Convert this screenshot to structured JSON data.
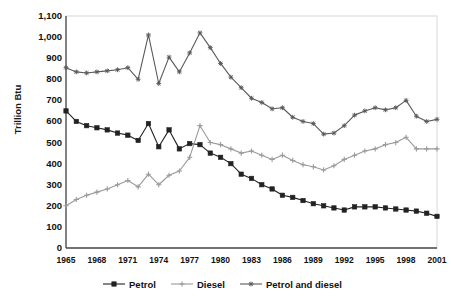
{
  "title": "",
  "axes": {
    "ylabel": "Trillion Btu",
    "yticks": [
      "1,100",
      "1,000",
      "900",
      "800",
      "700",
      "600",
      "500",
      "400",
      "300",
      "200",
      "100",
      "0"
    ],
    "xticks": [
      "1965",
      "1968",
      "1971",
      "1974",
      "1977",
      "1980",
      "1983",
      "1986",
      "1989",
      "1992",
      "1995",
      "1998",
      "2001"
    ]
  },
  "legend": {
    "items": [
      {
        "label": "Petrol",
        "marker": "square-marker",
        "color": "#222222"
      },
      {
        "label": "Diesel",
        "marker": "plus-marker",
        "color": "#9a9a9a"
      },
      {
        "label": "Petrol and diesel",
        "marker": "star-marker",
        "color": "#5a5a5a"
      }
    ]
  },
  "chart_data": {
    "type": "line",
    "title": "",
    "xlabel": "",
    "ylabel": "Trillion Btu",
    "ylim": [
      0,
      1100
    ],
    "ytick_step": 100,
    "grid": false,
    "legend_position": "bottom",
    "x": [
      1965,
      1966,
      1967,
      1968,
      1969,
      1970,
      1971,
      1972,
      1973,
      1974,
      1975,
      1976,
      1977,
      1978,
      1979,
      1980,
      1981,
      1982,
      1983,
      1984,
      1985,
      1986,
      1987,
      1988,
      1989,
      1990,
      1991,
      1992,
      1993,
      1994,
      1995,
      1996,
      1997,
      1998,
      1999,
      2000,
      2001
    ],
    "series": [
      {
        "name": "Petrol",
        "color": "#222222",
        "marker": "square-marker",
        "values": [
          650,
          600,
          580,
          570,
          560,
          545,
          535,
          510,
          590,
          480,
          560,
          470,
          495,
          490,
          450,
          430,
          400,
          350,
          330,
          300,
          280,
          250,
          240,
          225,
          210,
          200,
          190,
          180,
          195,
          195,
          195,
          190,
          185,
          180,
          175,
          165,
          150
        ]
      },
      {
        "name": "Diesel",
        "color": "#9a9a9a",
        "marker": "plus-marker",
        "values": [
          200,
          230,
          250,
          265,
          280,
          300,
          320,
          290,
          350,
          300,
          345,
          365,
          430,
          580,
          500,
          490,
          470,
          450,
          460,
          440,
          420,
          440,
          415,
          395,
          385,
          370,
          390,
          420,
          440,
          460,
          470,
          490,
          500,
          525,
          470,
          470,
          470
        ]
      },
      {
        "name": "Petrol and diesel",
        "color": "#5a5a5a",
        "marker": "star-marker",
        "values": [
          855,
          835,
          830,
          835,
          840,
          845,
          855,
          800,
          1010,
          780,
          905,
          835,
          925,
          1020,
          950,
          875,
          810,
          760,
          710,
          690,
          660,
          665,
          620,
          600,
          590,
          540,
          545,
          580,
          630,
          650,
          665,
          655,
          665,
          700,
          625,
          600,
          610
        ]
      }
    ]
  }
}
